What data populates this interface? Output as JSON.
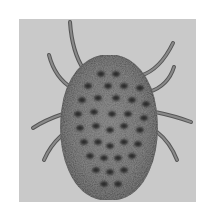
{
  "image": {
    "subject": "tick / mite (arachnid), dorsal view",
    "style": "grayscale photograph",
    "alt_text": "Grayscale photograph of an egg-shaped spotted tick with eight legs on a gray background"
  },
  "colors": {
    "page_background": "#ffffff",
    "photo_background": "#c9c9c9",
    "body": "#5e5e5e",
    "body_rim": "#4a4a4a",
    "spots": "#2c2c2c",
    "legs": "#8a8a8a",
    "leg_edge": "#555555"
  },
  "legs": [
    {
      "side": "left",
      "index": 1,
      "x1": 84,
      "y1": 70,
      "cx": 72,
      "cy": 52,
      "x2": 70,
      "y2": 22
    },
    {
      "side": "left",
      "index": 2,
      "x1": 72,
      "y1": 88,
      "cx": 55,
      "cy": 78,
      "x2": 49,
      "y2": 55
    },
    {
      "side": "left",
      "index": 3,
      "x1": 63,
      "y1": 114,
      "cx": 45,
      "cy": 120,
      "x2": 33,
      "y2": 128
    },
    {
      "side": "left",
      "index": 4,
      "x1": 61,
      "y1": 136,
      "cx": 50,
      "cy": 146,
      "x2": 44,
      "y2": 160
    },
    {
      "side": "right",
      "index": 1,
      "x1": 140,
      "y1": 76,
      "cx": 160,
      "cy": 70,
      "x2": 173,
      "y2": 43
    },
    {
      "side": "right",
      "index": 2,
      "x1": 149,
      "y1": 92,
      "cx": 168,
      "cy": 86,
      "x2": 174,
      "y2": 67
    },
    {
      "side": "right",
      "index": 3,
      "x1": 155,
      "y1": 112,
      "cx": 175,
      "cy": 116,
      "x2": 191,
      "y2": 122
    },
    {
      "side": "right",
      "index": 4,
      "x1": 157,
      "y1": 132,
      "cx": 170,
      "cy": 142,
      "x2": 177,
      "y2": 160
    }
  ],
  "spots": [
    [
      101,
      74
    ],
    [
      116,
      74
    ],
    [
      88,
      86
    ],
    [
      108,
      86
    ],
    [
      124,
      86
    ],
    [
      140,
      88
    ],
    [
      82,
      100
    ],
    [
      98,
      98
    ],
    [
      116,
      98
    ],
    [
      132,
      100
    ],
    [
      146,
      104
    ],
    [
      78,
      114
    ],
    [
      94,
      112
    ],
    [
      112,
      114
    ],
    [
      128,
      114
    ],
    [
      144,
      118
    ],
    [
      80,
      128
    ],
    [
      96,
      126
    ],
    [
      110,
      130
    ],
    [
      124,
      126
    ],
    [
      140,
      130
    ],
    [
      84,
      142
    ],
    [
      98,
      142
    ],
    [
      110,
      146
    ],
    [
      124,
      142
    ],
    [
      138,
      144
    ],
    [
      90,
      156
    ],
    [
      104,
      158
    ],
    [
      118,
      158
    ],
    [
      132,
      156
    ],
    [
      96,
      170
    ],
    [
      110,
      172
    ],
    [
      124,
      170
    ],
    [
      104,
      184
    ],
    [
      118,
      184
    ]
  ]
}
